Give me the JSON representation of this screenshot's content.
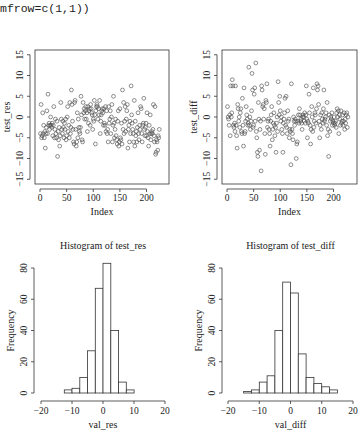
{
  "code_header": "mfrow=c(1,1))",
  "chart_data": [
    {
      "type": "scatter",
      "id": "scatter_res",
      "title": "",
      "xlabel": "Index",
      "ylabel": "test_res",
      "xlim": [
        0,
        233
      ],
      "ylim": [
        -15,
        15
      ],
      "xticks": [
        0,
        50,
        100,
        150,
        200
      ],
      "yticks": [
        -15,
        -10,
        -5,
        0,
        5,
        10,
        15
      ],
      "grid": false,
      "y": [
        -4,
        3,
        -5,
        -4.5,
        1,
        -4,
        -2,
        -5,
        -3.5,
        -7.5,
        -4,
        -2.5,
        1.5,
        -4,
        5.5,
        -2,
        -1.5,
        -3,
        -2,
        0,
        -2,
        -2.5,
        -1.5,
        -4.5,
        -2,
        2.5,
        -5,
        -3,
        -0.5,
        -4,
        -5,
        -1,
        -9.5,
        -3.5,
        -5.5,
        -2.5,
        -7,
        -4.5,
        3.5,
        -0.5,
        -3,
        -4,
        -1,
        -2.5,
        -5,
        -1.5,
        -3,
        -0.5,
        -5.5,
        -4.5,
        0,
        2.5,
        -3.5,
        -2,
        -5,
        3.5,
        -4,
        -2.5,
        6.5,
        3,
        -1,
        -3,
        -6,
        -6.5,
        3.5,
        4,
        -3,
        -7,
        -6,
        1,
        -5,
        -0.5,
        -2.5,
        -3.5,
        -4,
        -2.5,
        5,
        0.5,
        -5.5,
        -6,
        3.5,
        1,
        2,
        -0.5,
        1.5,
        2.5,
        -0.5,
        1,
        -3.5,
        2.5,
        -1.5,
        1.5,
        2,
        -2,
        3,
        2,
        1,
        0.5,
        -3,
        -0.5,
        -1,
        4,
        0.5,
        -6.5,
        1.5,
        2.5,
        3,
        2.5,
        -0.5,
        2,
        0.5,
        4,
        -4,
        -1,
        0.5,
        1.5,
        2,
        1,
        -2,
        2,
        -1.5,
        -2,
        2.5,
        -3.5,
        1.5,
        -4,
        -3,
        -6,
        2.5,
        -1.5,
        -0.5,
        1.5,
        -4,
        0,
        3,
        -6,
        -2,
        5,
        -1.5,
        -5,
        -3,
        -0.5,
        -4.5,
        -5.5,
        -6.5,
        -1,
        1.5,
        -7,
        -6,
        2,
        -5,
        -5.5,
        -1.5,
        -6.5,
        6.5,
        -3,
        3.5,
        -4,
        -1,
        2.5,
        -3.5,
        -0.5,
        1.5,
        3,
        -7.5,
        -3,
        -2,
        -6,
        -1,
        -4,
        7.5,
        0.5,
        -1.5,
        -3,
        -4,
        -6,
        4,
        -7,
        -1,
        -4.5,
        -3.5,
        -6,
        -2.5,
        1,
        -4,
        -5.5,
        -2,
        -3,
        2.5,
        2,
        -4,
        -6,
        -2,
        -1.5,
        4.5,
        -3,
        -4.5,
        -2.5,
        -1.5,
        -4.5,
        1,
        -3.5,
        -5,
        -7,
        -2,
        -4,
        0.5,
        -5.5,
        -4,
        -3.5,
        -4,
        -3,
        3,
        -4.5,
        -6,
        2.5,
        -9,
        -8.5,
        -5.5,
        -6,
        -8,
        -4.5,
        -5,
        -3
      ]
    },
    {
      "type": "scatter",
      "id": "scatter_diff",
      "title": "",
      "xlabel": "Index",
      "ylabel": "test_diff",
      "xlim": [
        0,
        233
      ],
      "ylim": [
        -15,
        15
      ],
      "xticks": [
        0,
        50,
        100,
        150,
        200
      ],
      "yticks": [
        -15,
        -10,
        -5,
        0,
        5,
        10,
        15
      ],
      "grid": false,
      "y": [
        2.5,
        0,
        -0.5,
        -2,
        0.5,
        -4.5,
        7.5,
        0,
        1,
        9,
        7.5,
        -2,
        -2.5,
        -1.5,
        -3.5,
        7.5,
        -2,
        -4.5,
        -7.5,
        3,
        2,
        -1,
        0,
        -2.5,
        1,
        2,
        -3.5,
        -4,
        4.5,
        -2,
        -7,
        7,
        -4,
        -3.5,
        -1,
        2.5,
        0.5,
        -0.5,
        -2,
        -1.5,
        12,
        -2,
        0,
        -3,
        -1,
        1.5,
        10.5,
        6.5,
        -2.5,
        -2,
        5.5,
        7,
        -1,
        13,
        -3.5,
        -5,
        -8.5,
        -9.5,
        3.5,
        -0.5,
        -8,
        -3,
        -1,
        -13,
        7.5,
        6.5,
        2.5,
        3,
        -0.5,
        2,
        -4,
        -9,
        4,
        3.5,
        8,
        -2.5,
        -1,
        -0.5,
        -3,
        -4,
        -7,
        -1,
        0.5,
        2.5,
        -5.5,
        -3,
        -1.5,
        1,
        -2,
        -4.5,
        -2.5,
        -8.5,
        -1.5,
        0,
        -3.5,
        8.5,
        3.5,
        0.5,
        5,
        1.5,
        -1,
        0,
        -3,
        -4,
        -8.5,
        -1.5,
        -0.5,
        1,
        4.5,
        -2,
        5,
        -2.5,
        -4,
        1.5,
        -1,
        -0.5,
        -5,
        -3,
        -3.5,
        -11.5,
        8,
        -3,
        -4,
        -5.5,
        0,
        -1,
        -2,
        -0.5,
        -1,
        -10,
        -6.5,
        -6,
        -1,
        0.5,
        -1.5,
        2,
        0.5,
        -1,
        -0.5,
        -1.5,
        -3,
        0,
        0.5,
        0,
        -1,
        1,
        -1.5,
        0.5,
        7.5,
        -0.5,
        -5,
        -1,
        -1.5,
        5.5,
        1,
        -2,
        -6.5,
        -3,
        2.5,
        0,
        -3.5,
        7,
        -2.5,
        -1,
        1,
        0.5,
        -1.5,
        2,
        8,
        6.5,
        7.5,
        3,
        -1,
        -5,
        -2,
        0.5,
        -3,
        1,
        -0.5,
        -1.5,
        2,
        6.5,
        -1,
        -0.5,
        0,
        1,
        -2,
        3.5,
        -4.5,
        -3,
        -9.5,
        0.5,
        -3.5,
        -1,
        0,
        -0.5,
        1,
        -2,
        -1,
        -1.5,
        0,
        -2,
        -1.5,
        -1,
        -2.5,
        1,
        2,
        0,
        1.5,
        -4,
        0.5,
        -0.5,
        -2,
        1.5,
        -1.5,
        -1,
        0.5,
        -2,
        -1,
        1,
        -3,
        -0.5,
        -1.5,
        0.5,
        1,
        -2.5,
        0
      ]
    },
    {
      "type": "bar",
      "id": "hist_res",
      "title": "Histogram of test_res",
      "xlabel": "val_res",
      "ylabel": "Frequency",
      "xlim": [
        -20,
        20
      ],
      "ylim": [
        0,
        80
      ],
      "xticks": [
        -20,
        -10,
        0,
        10,
        20
      ],
      "yticks": [
        0,
        20,
        40,
        60,
        80
      ],
      "bin_width": 2.5,
      "bin_starts": [
        -20,
        -17.5,
        -15,
        -12.5,
        -10,
        -7.5,
        -5,
        -2.5,
        0,
        2.5,
        5,
        7.5,
        10,
        12.5,
        15,
        17.5
      ],
      "values": [
        0,
        0,
        0,
        2,
        3,
        10,
        27,
        67,
        83,
        40,
        7,
        2,
        0,
        0,
        0,
        0
      ],
      "grid": false
    },
    {
      "type": "bar",
      "id": "hist_diff",
      "title": "Histogram of test_diff",
      "xlabel": "val_diff",
      "ylabel": "Frequency",
      "xlim": [
        -20,
        20
      ],
      "ylim": [
        0,
        80
      ],
      "xticks": [
        -20,
        -10,
        0,
        10,
        20
      ],
      "yticks": [
        0,
        20,
        40,
        60,
        80
      ],
      "bin_width": 2.5,
      "bin_starts": [
        -20,
        -17.5,
        -15,
        -12.5,
        -10,
        -7.5,
        -5,
        -2.5,
        0,
        2.5,
        5,
        7.5,
        10,
        12.5,
        15,
        17.5
      ],
      "values": [
        0,
        0,
        1,
        2,
        7,
        11,
        40,
        71,
        64,
        25,
        10,
        6,
        4,
        2,
        0,
        0
      ],
      "grid": false
    }
  ]
}
